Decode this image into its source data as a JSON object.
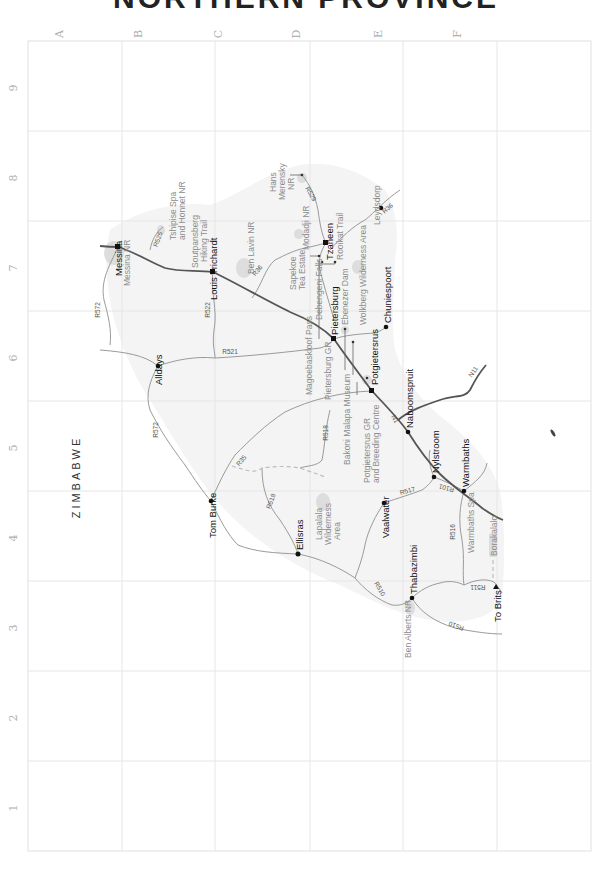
{
  "title": "NORTHERN PROVINCE",
  "grid": {
    "columns": [
      "A",
      "B",
      "C",
      "D",
      "E",
      "F"
    ],
    "rows": [
      "9",
      "8",
      "7",
      "6",
      "5",
      "4",
      "3",
      "2",
      "1"
    ]
  },
  "country_label": "ZIMBABWE",
  "towns": [
    {
      "name": "Messina",
      "x": 118,
      "y": 247
    },
    {
      "name": "Louis Trichardt",
      "x": 213,
      "y": 272
    },
    {
      "name": "Alldays",
      "x": 158,
      "y": 366
    },
    {
      "name": "Pietersburg",
      "x": 334,
      "y": 339
    },
    {
      "name": "Tzaneen",
      "x": 326,
      "y": 243
    },
    {
      "name": "Leydsdorp",
      "x": 381,
      "y": 208
    },
    {
      "name": "Chuniespoort",
      "x": 386,
      "y": 327
    },
    {
      "name": "Potgietersrus",
      "x": 372,
      "y": 391
    },
    {
      "name": "Naboomspruit",
      "x": 408,
      "y": 432
    },
    {
      "name": "Nylstroom",
      "x": 434,
      "y": 477
    },
    {
      "name": "Warmbaths",
      "x": 464,
      "y": 491
    },
    {
      "name": "Tom Burke",
      "x": 211,
      "y": 501
    },
    {
      "name": "Ellisras",
      "x": 298,
      "y": 554
    },
    {
      "name": "Vaalwater",
      "x": 384,
      "y": 503
    },
    {
      "name": "Thabazimbi",
      "x": 412,
      "y": 598
    },
    {
      "name": "To Brits",
      "x": 496,
      "y": 584
    }
  ],
  "points_of_interest": [
    {
      "name": "Messina NR"
    },
    {
      "name": "Tshipise Spa and Honnet NR"
    },
    {
      "name": "Soutpansberg Hiking Trail"
    },
    {
      "name": "Ben Lavin NR"
    },
    {
      "name": "Hans Merensky NR"
    },
    {
      "name": "Modadji NR"
    },
    {
      "name": "Rooikat Trail"
    },
    {
      "name": "Sapekoe Tea Estate"
    },
    {
      "name": "Debengeni Falls"
    },
    {
      "name": "Ebenezer Dam"
    },
    {
      "name": "Wolkberg Wilderness Area"
    },
    {
      "name": "Magoebaskloof Pass"
    },
    {
      "name": "Pietersburg GR"
    },
    {
      "name": "Bakoni Malapa Museum"
    },
    {
      "name": "Potgietersrus GR and Breeding Centre"
    },
    {
      "name": "Lapalala Wilderness Area"
    },
    {
      "name": "Warmbaths Spa"
    },
    {
      "name": "Borakalalo"
    },
    {
      "name": "Ben Alberts NR"
    }
  ],
  "roads": {
    "R572_north": "R572",
    "R525": "R525",
    "R522": "R522",
    "R521": "R521",
    "R36_west": "R36",
    "R529": "R529",
    "R36_east": "R36",
    "R572_south": "R572",
    "R35": "R35",
    "R518_north": "R518",
    "R518_south": "R518",
    "N1": "N1",
    "N11": "N11",
    "R517": "R517",
    "R101": "R101",
    "R516": "R516",
    "R511": "R511",
    "R510_north": "R510",
    "R510_south": "R510"
  },
  "labels": {
    "messina": "Messina",
    "messina_nr": "Messina NR",
    "tshipise_1": "Tshipise Spa",
    "tshipise_2": "and Honnet NR",
    "soutpansberg_1": "Soutpansberg",
    "soutpansberg_2": "Hiking Trail",
    "louis_trichardt": "Louis Trichardt",
    "ben_lavin": "Ben Lavin NR",
    "hans_1": "Hans",
    "hans_2": "Merensky",
    "hans_3": "NR",
    "modadji": "Modadji NR",
    "tzaneen": "Tzaneen",
    "rooikat": "Rooikat Trail",
    "leydsdorp": "Leydsdorp",
    "sapekoe_1": "Sapekoe",
    "sapekoe_2": "Tea Estate",
    "debengeni": "Debengeni Falls",
    "ebenezer": "Ebenezer Dam",
    "wolkberg": "Wolkberg Wilderness Area",
    "chuniespoort": "Chuniespoort",
    "pietersburg": "Pietersburg",
    "magoebaskloof": "Magoebaskloof Pass",
    "pietersburg_gr": "Pietersburg GR",
    "bakoni": "Bakoni Malapa Museum",
    "potgietersrus": "Potgietersrus",
    "potg_gr_1": "Potgietersrus GR",
    "potg_gr_2": "and Breeding Centre",
    "naboomspruit": "Naboomspruit",
    "nylstroom": "Nylstroom",
    "warmbaths": "Warmbaths",
    "warmbaths_spa": "Warmbaths Spa",
    "borakalalo": "Borakalalo",
    "alldays": "Alldays",
    "tom_burke": "Tom Burke",
    "lapalala_1": "Lapalala",
    "lapalala_2": "Wilderness",
    "lapalala_3": "Area",
    "ellisras": "Ellisras",
    "vaalwater": "Vaalwater",
    "thabazimbi": "Thabazimbi",
    "ben_alberts": "Ben Alberts NR",
    "to_brits": "To Brits"
  },
  "colors": {
    "national_road": "#555555",
    "regional_road": "#9a9a9a",
    "province_fill": "#f4f4f4",
    "reserve_fill": "#d8d8d8",
    "grid": "#e6e6e6"
  }
}
